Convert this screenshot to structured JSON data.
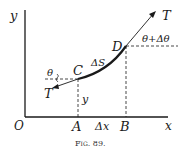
{
  "figure": {
    "caption": "Fig. 89.",
    "axes": {
      "x_label": "x",
      "y_label": "y",
      "origin_label": "O"
    },
    "points": {
      "A": "A",
      "B": "B",
      "C": "C",
      "D": "D"
    },
    "labels": {
      "delta_x": "Δx",
      "delta_s": "ΔS",
      "y": "y",
      "theta": "θ",
      "theta_plus": "θ+Δθ",
      "tension_top": "T",
      "tension_bottom": "T"
    },
    "colors": {
      "ink": "#1a1a1a",
      "background": "#ffffff"
    }
  }
}
